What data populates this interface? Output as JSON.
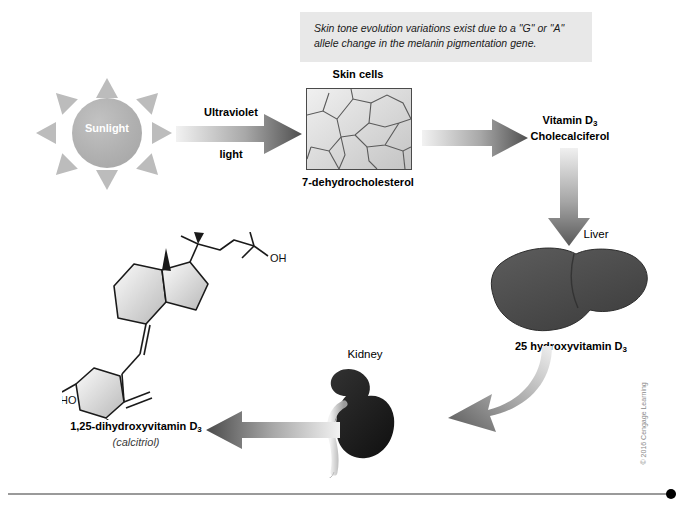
{
  "figure": {
    "callout": {
      "line1": "Skin tone evolution variations exist due to a \"G\" or \"A\"",
      "line2": "allele change in the melanin pigmentation gene."
    },
    "sun": {
      "label": "Sunlight",
      "ray_count": 8,
      "color": "#b0b0b0",
      "ray_color": "#bcbcbc"
    },
    "arrows": [
      {
        "name": "ultraviolet-light-arrow",
        "label_top": "Ultraviolet",
        "label_bottom": "light",
        "direction": "right"
      },
      {
        "name": "skin-to-vitd3-arrow",
        "direction": "right"
      },
      {
        "name": "vitd3-to-liver-arrow",
        "direction": "down"
      },
      {
        "name": "liver-to-kidney-arrow",
        "direction": "curved-left"
      },
      {
        "name": "kidney-to-calcitriol-arrow",
        "direction": "left"
      }
    ],
    "skin": {
      "title": "Skin cells",
      "molecule": "7-dehydrocholesterol"
    },
    "vitamin_d3": {
      "line1_prefix": "Vitamin D",
      "line1_sub": "3",
      "line2": "Cholecalciferol"
    },
    "liver": {
      "organ_label": "Liver",
      "product_prefix": "25 hydroxyvitamin D",
      "product_sub": "3",
      "color": "#4a4a4a"
    },
    "kidney": {
      "organ_label": "Kidney",
      "color": "#2b2b2b"
    },
    "calcitriol": {
      "name_prefix": "1,25-dihydroxyvitamin D",
      "name_sub": "3",
      "alias": "(calcitriol)"
    },
    "structure": {
      "name": "calcitriol-chemical-structure",
      "atom_labels": [
        "OH",
        "HO",
        "OH"
      ]
    },
    "copyright": "© 2016 Cengage Learning",
    "footer_rule": {
      "color": "#9a9a9a",
      "dot_color": "#000000"
    }
  }
}
